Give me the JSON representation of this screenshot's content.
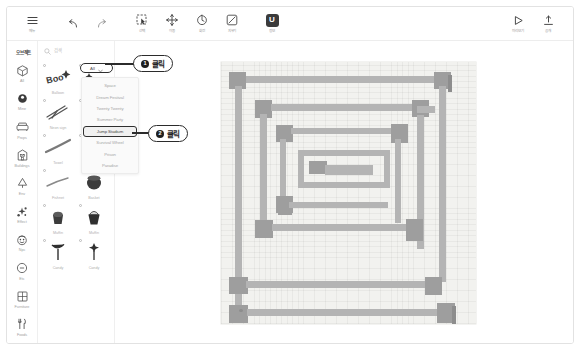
{
  "app": {
    "title": "맵 에디터"
  },
  "toolbar": {
    "menu": {
      "label": "메뉴",
      "icon": "hamburger-icon"
    },
    "undo": {
      "label": "",
      "icon": "undo-icon"
    },
    "redo": {
      "label": "",
      "icon": "redo-icon"
    },
    "tools": [
      {
        "label": "선택",
        "icon": "select-icon"
      },
      {
        "label": "이동",
        "icon": "move-icon"
      },
      {
        "label": "회전",
        "icon": "rotate-icon"
      },
      {
        "label": "지우기",
        "icon": "eraser-icon"
      }
    ],
    "brand": {
      "label": "정보",
      "icon": "logo-icon",
      "glyph": "U"
    },
    "right": [
      {
        "label": "미리보기",
        "icon": "play-icon"
      },
      {
        "label": "공개",
        "icon": "publish-icon"
      }
    ]
  },
  "sidebar": {
    "title": "오브젝트",
    "items": [
      {
        "label": "All",
        "icon": "cube-icon"
      },
      {
        "label": "Mine",
        "icon": "circle-filled-icon"
      },
      {
        "label": "Props",
        "icon": "sofa-icon"
      },
      {
        "label": "Buildings",
        "icon": "building-icon"
      },
      {
        "label": "Env",
        "icon": "tree-icon"
      },
      {
        "label": "Effect",
        "icon": "sparkle-icon"
      },
      {
        "label": "Npc",
        "icon": "face-icon"
      },
      {
        "label": "Etc",
        "icon": "minus-circle-icon"
      },
      {
        "label": "Furniture",
        "icon": "window-icon"
      },
      {
        "label": "Foods",
        "icon": "fork-knife-icon"
      }
    ]
  },
  "assets": {
    "search": {
      "placeholder": "검색",
      "value": "",
      "icon": "search-icon"
    },
    "filter": {
      "label": "All",
      "icon": "chevron-down-icon"
    },
    "items": [
      {
        "name": "Balloon",
        "thumb": "balloon"
      },
      {
        "name": "",
        "thumb": "sparkle"
      },
      {
        "name": "Neon sign",
        "thumb": "neon"
      },
      {
        "name": "",
        "thumb": "line"
      },
      {
        "name": "Towel",
        "thumb": "towel"
      },
      {
        "name": "Towel",
        "thumb": "towel2"
      },
      {
        "name": "Fishnet",
        "thumb": "fishnet"
      },
      {
        "name": "Basket",
        "thumb": "basket"
      },
      {
        "name": "Muffin",
        "thumb": "muffin"
      },
      {
        "name": "Muffin",
        "thumb": "muffin2"
      },
      {
        "name": "Candy",
        "thumb": "candy"
      },
      {
        "name": "Candy",
        "thumb": "candy2"
      }
    ]
  },
  "dropdown": {
    "trigger_label": "All",
    "options": [
      {
        "label": "Space",
        "selected": false
      },
      {
        "label": "Dream Festival",
        "selected": false
      },
      {
        "label": "Twenty Twenty",
        "selected": false
      },
      {
        "label": "Summer Party",
        "selected": false
      },
      {
        "label": "Jump Stadium",
        "selected": true
      },
      {
        "label": "Survival Wheel",
        "selected": false
      },
      {
        "label": "Prison",
        "selected": false
      },
      {
        "label": "Paradise",
        "selected": false
      }
    ]
  },
  "callouts": [
    {
      "number": "❶",
      "text": "클릭"
    },
    {
      "number": "❷",
      "text": "클릭"
    }
  ],
  "map": {
    "name": "Jump Stadium",
    "grid": true
  },
  "colors": {
    "wall": "#b4b4b4",
    "node": "#9e9e9e",
    "canvas_bg": "#f2f2ef",
    "accent": "#2b2b2b"
  }
}
